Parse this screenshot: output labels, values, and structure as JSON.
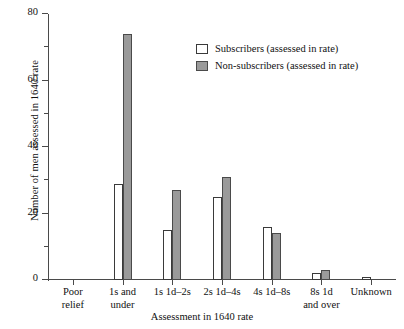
{
  "chart_data": {
    "type": "bar",
    "title": "",
    "xlabel": "Assessment in 1640 rate",
    "ylabel": "Number of men assessed in 1640 rate",
    "categories": [
      "Poor\nrelief",
      "1s and\nunder",
      "1s 1d–2s",
      "2s 1d–4s",
      "4s 1d–8s",
      "8s 1d\nand over",
      "Unknown"
    ],
    "series": [
      {
        "name": "Subscribers (assessed in rate)",
        "color": "#ffffff",
        "values": [
          0,
          29,
          15,
          25,
          16,
          2,
          1
        ]
      },
      {
        "name": "Non-subscribers (assessed in rate)",
        "color": "#9a9a9a",
        "values": [
          0,
          74,
          27,
          31,
          14,
          3,
          0
        ]
      }
    ],
    "ylim": [
      0,
      80
    ],
    "yticks": [
      0,
      20,
      40,
      60,
      80
    ],
    "ytick_labels": [
      "0",
      "20",
      "40",
      "60",
      "80"
    ],
    "yminor_ticks": [
      10,
      30,
      50,
      70
    ],
    "grid": false,
    "legend_position": "upper-center-right"
  },
  "legend": {
    "items": [
      {
        "label": "Subscribers (assessed in rate)"
      },
      {
        "label": "Non-subscribers (assessed in rate)"
      }
    ]
  }
}
